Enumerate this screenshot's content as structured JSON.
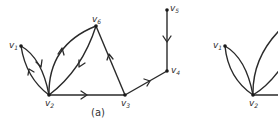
{
  "figure": {
    "panels": [
      {
        "id": "a",
        "caption": "(a)",
        "vertices": [
          {
            "name": "v1",
            "base": "v",
            "sub": "1",
            "x": 21,
            "y": 46
          },
          {
            "name": "v2",
            "base": "v",
            "sub": "2",
            "x": 49,
            "y": 95
          },
          {
            "name": "v3",
            "base": "v",
            "sub": "3",
            "x": 125,
            "y": 95
          },
          {
            "name": "v4",
            "base": "v",
            "sub": "4",
            "x": 167,
            "y": 71
          },
          {
            "name": "v5",
            "base": "v",
            "sub": "5",
            "x": 167,
            "y": 10
          },
          {
            "name": "v6",
            "base": "v",
            "sub": "6",
            "x": 96,
            "y": 26
          }
        ],
        "edges": [
          {
            "from": "v1",
            "to": "v2",
            "directed": true,
            "curve": "upper"
          },
          {
            "from": "v2",
            "to": "v1",
            "directed": true,
            "curve": "lower"
          },
          {
            "from": "v2",
            "to": "v6",
            "directed": true,
            "curve": "outer"
          },
          {
            "from": "v6",
            "to": "v2",
            "directed": true,
            "curve": "inner"
          },
          {
            "from": "v2",
            "to": "v3",
            "directed": true
          },
          {
            "from": "v3",
            "to": "v6",
            "directed": true
          },
          {
            "from": "v3",
            "to": "v4",
            "directed": true
          },
          {
            "from": "v5",
            "to": "v4",
            "directed": true
          }
        ]
      },
      {
        "id": "b",
        "caption": "",
        "partial": true,
        "vertices": [
          {
            "name": "v1",
            "base": "v",
            "sub": "1",
            "x": 225,
            "y": 46
          },
          {
            "name": "v2",
            "base": "v",
            "sub": "2",
            "x": 253,
            "y": 95
          }
        ],
        "edges": [
          {
            "from": "v1",
            "to": "v2",
            "directed": false
          },
          {
            "from": "v1",
            "to": "v2",
            "directed": false
          },
          {
            "from": "v2",
            "to": "v6",
            "directed": false
          },
          {
            "from": "v2",
            "to": "v6",
            "directed": false
          },
          {
            "from": "v2",
            "to": "v3",
            "directed": false
          }
        ]
      }
    ]
  },
  "labels": {
    "a_v1": "v",
    "a_v1_sub": "1",
    "a_v2": "v",
    "a_v2_sub": "2",
    "a_v3": "v",
    "a_v3_sub": "3",
    "a_v4": "v",
    "a_v4_sub": "4",
    "a_v5": "v",
    "a_v5_sub": "5",
    "a_v6": "v",
    "a_v6_sub": "6",
    "b_v1": "v",
    "b_v1_sub": "1",
    "b_v2": "v",
    "b_v2_sub": "2",
    "caption_a": "(a)"
  }
}
